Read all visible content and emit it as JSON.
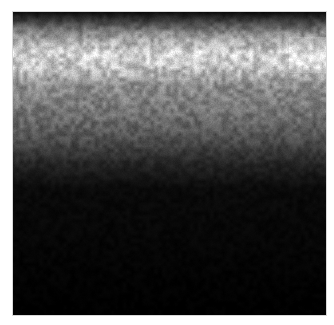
{
  "image": {
    "kind": "grayscale-noise-texture",
    "description": "Grayscale noisy intensity image: dark top edge, bright speckled band near top, fading through gray to black in lower half",
    "background_color": "#ffffff",
    "intensity_profile": [
      {
        "pos": 0.0,
        "level": 0.05
      },
      {
        "pos": 0.03,
        "level": 0.25
      },
      {
        "pos": 0.07,
        "level": 0.55
      },
      {
        "pos": 0.13,
        "level": 0.82
      },
      {
        "pos": 0.18,
        "level": 0.78
      },
      {
        "pos": 0.24,
        "level": 0.55
      },
      {
        "pos": 0.33,
        "level": 0.45
      },
      {
        "pos": 0.42,
        "level": 0.3
      },
      {
        "pos": 0.5,
        "level": 0.14
      },
      {
        "pos": 0.58,
        "level": 0.04
      },
      {
        "pos": 1.0,
        "level": 0.0
      }
    ]
  }
}
